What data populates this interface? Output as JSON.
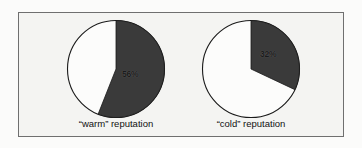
{
  "figure": {
    "background_color": "#f4f4f2",
    "border_color": "#6f6f6f",
    "slice_color": "#3a3a3a",
    "unfilled_color": "#fcfcfb",
    "outline_color": "#1a1a1a"
  },
  "charts": [
    {
      "id": "warm",
      "caption": "“warm” reputation",
      "label": "56%"
    },
    {
      "id": "cold",
      "caption": "“cold” reputation",
      "label": "32%"
    }
  ],
  "chart_data": [
    {
      "type": "pie",
      "title": "“warm” reputation",
      "categories": [
        "shaded",
        "unshaded"
      ],
      "values": [
        56,
        44
      ],
      "labels": [
        "56%",
        ""
      ],
      "units": "percent",
      "start_angle_deg": 0,
      "direction": "clockwise",
      "colors": [
        "#3a3a3a",
        "#fcfcfb"
      ],
      "legend": "none",
      "grid": false
    },
    {
      "type": "pie",
      "title": "“cold” reputation",
      "categories": [
        "shaded",
        "unshaded"
      ],
      "values": [
        32,
        68
      ],
      "labels": [
        "32%",
        ""
      ],
      "units": "percent",
      "start_angle_deg": 0,
      "direction": "clockwise",
      "colors": [
        "#3a3a3a",
        "#fcfcfb"
      ],
      "legend": "none",
      "grid": false
    }
  ]
}
